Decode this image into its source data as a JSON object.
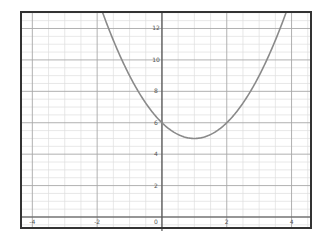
{
  "chart_data": {
    "type": "line",
    "title": "",
    "xlabel": "",
    "ylabel": "",
    "function": "y = x^2 - 2x + 6",
    "series": [
      {
        "name": "parabola",
        "color": "#8a8a8a",
        "x": [
          -1.84,
          -1.5,
          -1,
          -0.5,
          0,
          0.5,
          1,
          1.5,
          2,
          2.5,
          3,
          3.5,
          3.84
        ],
        "values": [
          13.05,
          11.25,
          9,
          7.25,
          6,
          5.25,
          5,
          5.25,
          6,
          7.25,
          9,
          11.25,
          13.05
        ]
      }
    ],
    "vertex": {
      "x": 1,
      "y": 5
    },
    "xlim": [
      -4.35,
      4.6
    ],
    "ylim": [
      -0.7,
      13.05
    ],
    "x_ticks": [
      -4,
      -2,
      0,
      2,
      4
    ],
    "x_tick_labels": [
      "-4",
      "-2",
      "0",
      "2",
      "4"
    ],
    "y_ticks": [
      2,
      4,
      6,
      8,
      10,
      12
    ],
    "y_tick_labels": [
      "2",
      "4",
      "6",
      "8",
      "10",
      "12"
    ],
    "grid": true,
    "minor_grid_step": 0.5,
    "major_grid_step": 2,
    "legend": null
  },
  "colors": {
    "frame": "#333333",
    "axis": "#555555",
    "major_grid": "#a8a8a8",
    "minor_grid": "#dedede",
    "curve": "#8a8a8a"
  }
}
